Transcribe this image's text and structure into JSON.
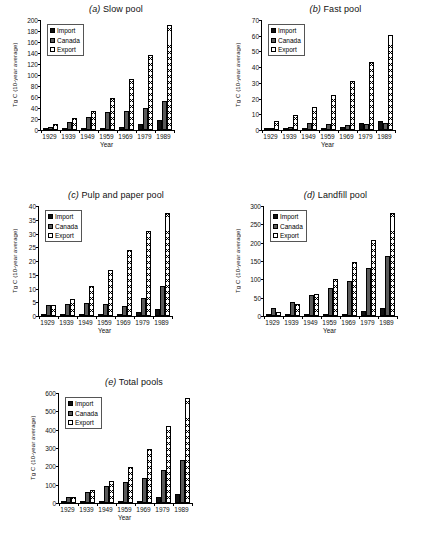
{
  "figure": {
    "background": "#ffffff",
    "series_names": [
      "Import",
      "Canada",
      "Export"
    ],
    "colors": {
      "import": "#111111",
      "canada": "#595959",
      "export": "#ffffff"
    },
    "xlabel": "Year",
    "ylabel": "Tg C (10-year average)"
  },
  "panels": [
    {
      "tag": "(a)",
      "name": "Slow pool",
      "title": "(a) Slow pool"
    },
    {
      "tag": "(b)",
      "name": "Fast pool",
      "title": "(b) Fast pool"
    },
    {
      "tag": "(c)",
      "name": "Pulp and paper pool",
      "title": "(c) Pulp and paper pool"
    },
    {
      "tag": "(d)",
      "name": "Landfill pool",
      "title": "(d) Landfill pool"
    },
    {
      "tag": "(e)",
      "name": "Total pools",
      "title": "(e) Total pools"
    }
  ],
  "chart_data": [
    {
      "type": "bar",
      "title": "(a) Slow pool",
      "xlabel": "Year",
      "ylabel": "Tg C (10-year average)",
      "categories": [
        "1929",
        "1939",
        "1949",
        "1959",
        "1969",
        "1979",
        "1989"
      ],
      "series": [
        {
          "name": "Import",
          "values": [
            0.5,
            2,
            2,
            3.5,
            5.5,
            11,
            18
          ]
        },
        {
          "name": "Canada",
          "values": [
            6,
            14,
            24,
            32,
            35,
            40,
            53
          ]
        },
        {
          "name": "Export",
          "values": [
            11,
            21,
            35,
            58,
            92,
            137,
            191
          ]
        }
      ],
      "ylim": [
        0,
        200
      ],
      "yticks": [
        0,
        20,
        40,
        60,
        80,
        100,
        120,
        140,
        160,
        180,
        200
      ],
      "grid": false,
      "legend_position": "upper-left"
    },
    {
      "type": "bar",
      "title": "(b) Fast pool",
      "xlabel": "Year",
      "ylabel": "Tg C (10-year average)",
      "categories": [
        "1929",
        "1939",
        "1949",
        "1959",
        "1969",
        "1979",
        "1989"
      ],
      "series": [
        {
          "name": "Import",
          "values": [
            0.3,
            0.4,
            0.5,
            1.2,
            1.8,
            4.2,
            5.8
          ]
        },
        {
          "name": "Canada",
          "values": [
            1.0,
            1.8,
            4.7,
            3.6,
            3.2,
            3.8,
            4.5
          ]
        },
        {
          "name": "Export",
          "values": [
            5.6,
            9.5,
            14.4,
            22,
            31.5,
            43,
            60.5
          ]
        }
      ],
      "ylim": [
        0,
        70
      ],
      "yticks": [
        0,
        10,
        20,
        30,
        40,
        50,
        60,
        70
      ],
      "grid": false,
      "legend_position": "upper-left"
    },
    {
      "type": "bar",
      "title": "(c) Pulp and paper pool",
      "xlabel": "Year",
      "ylabel": "Tg C (10-year average)",
      "categories": [
        "1929",
        "1939",
        "1949",
        "1959",
        "1969",
        "1979",
        "1989"
      ],
      "series": [
        {
          "name": "Import",
          "values": [
            0.1,
            0.2,
            0.3,
            0.6,
            0.8,
            1.5,
            2.7
          ]
        },
        {
          "name": "Canada",
          "values": [
            4.0,
            4.2,
            4.9,
            4.5,
            3.6,
            6.7,
            11.0
          ]
        },
        {
          "name": "Export",
          "values": [
            4.0,
            6.3,
            10.8,
            16.8,
            23.9,
            31.0,
            37.5
          ]
        }
      ],
      "ylim": [
        0,
        40
      ],
      "yticks": [
        0,
        5,
        10,
        15,
        20,
        25,
        30,
        35,
        40
      ],
      "grid": false,
      "legend_position": "upper-left"
    },
    {
      "type": "bar",
      "title": "(d) Landfill pool",
      "xlabel": "Year",
      "ylabel": "Tg C (10-year average)",
      "categories": [
        "1929",
        "1939",
        "1949",
        "1959",
        "1969",
        "1979",
        "1989"
      ],
      "series": [
        {
          "name": "Import",
          "values": [
            1,
            2,
            3,
            4,
            6,
            13,
            21
          ]
        },
        {
          "name": "Canada",
          "values": [
            21,
            39,
            57,
            76,
            96,
            131,
            164
          ]
        },
        {
          "name": "Export",
          "values": [
            12,
            32,
            61,
            101,
            146,
            207,
            281
          ]
        }
      ],
      "ylim": [
        0,
        300
      ],
      "yticks": [
        0,
        50,
        100,
        150,
        200,
        250,
        300
      ],
      "grid": false,
      "legend_position": "upper-left"
    },
    {
      "type": "bar",
      "title": "(e) Total pools",
      "xlabel": "Year",
      "ylabel": "Tg C (10-year average)",
      "categories": [
        "1929",
        "1939",
        "1949",
        "1959",
        "1969",
        "1979",
        "1989"
      ],
      "series": [
        {
          "name": "Import",
          "values": [
            2,
            3,
            5,
            8,
            13,
            31,
            47
          ]
        },
        {
          "name": "Canada",
          "values": [
            32,
            60,
            93,
            115,
            139,
            181,
            233
          ]
        },
        {
          "name": "Export",
          "values": [
            34,
            69,
            121,
            199,
            293,
            418,
            571
          ]
        }
      ],
      "ylim": [
        0,
        600
      ],
      "yticks": [
        0,
        100,
        200,
        300,
        400,
        500,
        600
      ],
      "grid": false,
      "legend_position": "upper-left"
    }
  ]
}
